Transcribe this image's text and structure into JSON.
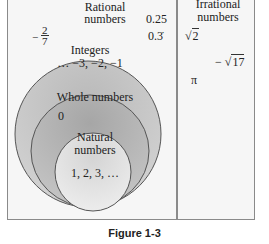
{
  "diagram": {
    "regions": {
      "rational": {
        "title_line1": "Rational",
        "title_line2": "numbers",
        "examples": [
          "0.25",
          "0.3̇"
        ],
        "fraction": {
          "sign": "−",
          "numerator": "2",
          "denominator": "7"
        }
      },
      "irrational": {
        "title_line1": "Irrational",
        "title_line2": "numbers",
        "examples": {
          "sqrt2_radical": "√",
          "sqrt2_value": "2",
          "neg_sqrt17_sign": "−",
          "neg_sqrt17_radical": "√",
          "neg_sqrt17_value": "17",
          "pi": "π"
        }
      },
      "integers": {
        "title": "Integers",
        "examples": "… −3, −2, −1"
      },
      "whole": {
        "title": "Whole numbers",
        "examples": "0"
      },
      "natural": {
        "title_line1": "Natural",
        "title_line2": "numbers",
        "examples": "1, 2, 3, …"
      }
    },
    "colors": {
      "background": "#f6f6f6",
      "integers_fill": "#c9c9c9",
      "whole_fill": "#b5b5b5",
      "natural_fill": "#e4e4e4",
      "stroke": "#555555"
    }
  },
  "caption": "Figure 1-3"
}
